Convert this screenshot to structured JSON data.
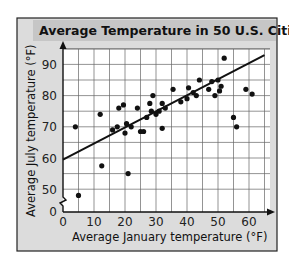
{
  "chart_data": {
    "type": "scatter",
    "title": "Average Temperature in 50 U.S. Cities",
    "xlabel": "Average January temperature (°F)",
    "ylabel": "Average July temperature (°F)",
    "xlim": [
      0,
      65
    ],
    "ylim": [
      45,
      95
    ],
    "y_axis_break": true,
    "x_ticks": [
      0,
      10,
      20,
      30,
      40,
      50,
      60
    ],
    "y_ticks": [
      50,
      60,
      70,
      80,
      90
    ],
    "y_tick_labels": [
      "0",
      "50",
      "60",
      "70",
      "80",
      "90"
    ],
    "grid": true,
    "grid_step": 5,
    "legend": null,
    "trend_line": {
      "x": [
        0,
        65
      ],
      "y": [
        59.5,
        93
      ]
    },
    "points": [
      {
        "x": 4,
        "y": 70
      },
      {
        "x": 5,
        "y": 48
      },
      {
        "x": 12.5,
        "y": 57.5
      },
      {
        "x": 12,
        "y": 74
      },
      {
        "x": 16,
        "y": 69
      },
      {
        "x": 17.5,
        "y": 70
      },
      {
        "x": 18,
        "y": 76
      },
      {
        "x": 19.5,
        "y": 77
      },
      {
        "x": 20,
        "y": 68
      },
      {
        "x": 20.5,
        "y": 71
      },
      {
        "x": 21,
        "y": 55
      },
      {
        "x": 22,
        "y": 70
      },
      {
        "x": 24,
        "y": 76
      },
      {
        "x": 25,
        "y": 68.5
      },
      {
        "x": 26,
        "y": 68.5
      },
      {
        "x": 27,
        "y": 73
      },
      {
        "x": 28,
        "y": 77.5
      },
      {
        "x": 28.5,
        "y": 75
      },
      {
        "x": 29,
        "y": 80
      },
      {
        "x": 30,
        "y": 74
      },
      {
        "x": 31,
        "y": 75
      },
      {
        "x": 32,
        "y": 77.5
      },
      {
        "x": 32,
        "y": 69.5
      },
      {
        "x": 33,
        "y": 76
      },
      {
        "x": 35.5,
        "y": 82
      },
      {
        "x": 38,
        "y": 78
      },
      {
        "x": 40,
        "y": 79
      },
      {
        "x": 40.5,
        "y": 82.5
      },
      {
        "x": 42,
        "y": 81
      },
      {
        "x": 43,
        "y": 80
      },
      {
        "x": 44,
        "y": 85
      },
      {
        "x": 47,
        "y": 82
      },
      {
        "x": 48,
        "y": 84.5
      },
      {
        "x": 49,
        "y": 80
      },
      {
        "x": 50,
        "y": 85
      },
      {
        "x": 50.5,
        "y": 81.5
      },
      {
        "x": 51,
        "y": 83
      },
      {
        "x": 52,
        "y": 92
      },
      {
        "x": 55,
        "y": 73
      },
      {
        "x": 56,
        "y": 70
      },
      {
        "x": 59,
        "y": 82
      },
      {
        "x": 61,
        "y": 80.5
      }
    ]
  },
  "colors": {
    "frame_bg": "#dcdcdc",
    "title_band": "#c8c8c8",
    "plot_bg": "#ffffff",
    "grid": "#555555",
    "ink": "#111111"
  }
}
